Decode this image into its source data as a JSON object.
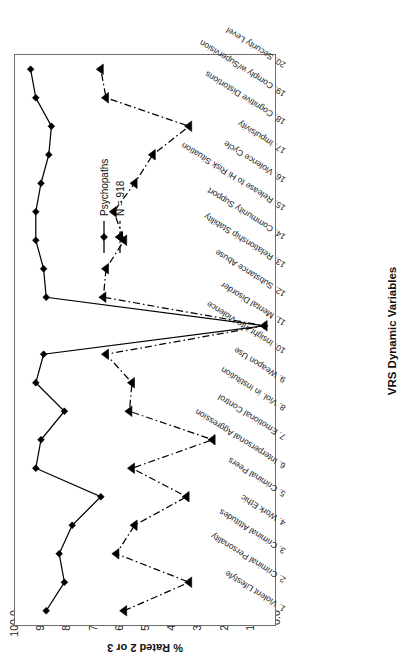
{
  "chart_data": {
    "type": "line",
    "title": "",
    "xlabel": "VRS Dynamic Variables",
    "ylabel": "% Rated 2 or 3",
    "ylim": [
      0.0,
      100.0
    ],
    "ytick_labels": [
      "100.0",
      "90.0",
      "80.0",
      "70.0",
      "60.0",
      "50.0",
      "40.0",
      "30.0",
      "20.0",
      "10.0",
      "0.0"
    ],
    "ytick_values": [
      100.0,
      90.0,
      80.0,
      70.0,
      60.0,
      50.0,
      40.0,
      30.0,
      20.0,
      10.0,
      0.0
    ],
    "grid": false,
    "legend_position": "right",
    "categories": [
      "1. Violent Lifestyle",
      "2. Criminal Personality",
      "3. Criminal Attitudes",
      "4. Work Ethic",
      "5. Criminal Peers",
      "6. Interpersonal Aggression",
      "7. Emotional Control",
      "8. Viol. in Institution",
      "9. Weapon Use",
      "10. Insight into Violence",
      "11. Mental Disorder",
      "12. Substance Abuse",
      "13. Relationship Stability",
      "14. Community Support",
      "15. Release to Hi Risk Situation",
      "16. Violence Cycle",
      "17. Impulsivity",
      "18. Cognitive Distortions",
      "19. Comply w/Supervision",
      "20. Security Level"
    ],
    "series": [
      {
        "name": "Psychopaths",
        "marker": "diamond",
        "line_style": "solid",
        "color": "#000000",
        "values": [
          88.0,
          81.0,
          83.0,
          78.0,
          67.0,
          92.0,
          90.0,
          81.0,
          92.0,
          89.0,
          4.0,
          88.0,
          89.0,
          92.0,
          92.0,
          90.0,
          87.0,
          86.0,
          92.0,
          94.0
        ]
      },
      {
        "name": "N = 918",
        "marker": "triangle",
        "line_style": "dashdot",
        "color": "#000000",
        "values": [
          58.0,
          33.0,
          61.0,
          54.0,
          34.0,
          55.0,
          24.0,
          56.0,
          55.0,
          65.0,
          4.0,
          66.0,
          65.0,
          58.0,
          62.0,
          54.0,
          47.0,
          33.0,
          65.0,
          67.0
        ]
      }
    ]
  },
  "legend": {
    "items": [
      {
        "label": "Psychopaths"
      },
      {
        "label": "N = 918"
      }
    ]
  },
  "axes": {
    "x_title": "VRS Dynamic Variables",
    "y_title": "% Rated 2 or 3"
  }
}
